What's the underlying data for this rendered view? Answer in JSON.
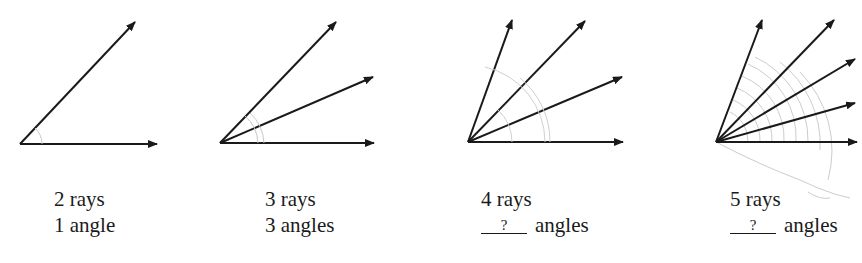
{
  "figures": [
    {
      "rays_label": "2 rays",
      "angles_value": "1",
      "angles_word": "angle",
      "has_blank": false
    },
    {
      "rays_label": "3 rays",
      "angles_value": "3",
      "angles_word": "angles",
      "has_blank": false
    },
    {
      "rays_label": "4 rays",
      "angles_value": "?",
      "angles_word": "angles",
      "has_blank": true
    },
    {
      "rays_label": "5 rays",
      "angles_value": "?",
      "angles_word": "angles",
      "has_blank": true
    }
  ],
  "colors": {
    "ray": "#1a1a1a",
    "arc": "#c8c8c8",
    "background": "#ffffff"
  }
}
